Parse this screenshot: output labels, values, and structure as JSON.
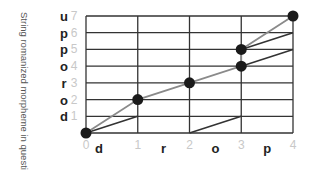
{
  "chart_data": {
    "type": "line",
    "title": "",
    "ylabel": "String romanized morpheme in question",
    "xlabel": "",
    "x_ticks": [
      "0",
      "1",
      "2",
      "3",
      "4"
    ],
    "y_ticks": [
      "1",
      "2",
      "3",
      "4",
      "5",
      "6",
      "7"
    ],
    "x_letters": [
      "d",
      "r",
      "o",
      "p"
    ],
    "y_letters": [
      "d",
      "o",
      "r",
      "o",
      "p",
      "p",
      "u"
    ],
    "xlim": [
      0,
      4
    ],
    "ylim": [
      0,
      7
    ],
    "grid": true,
    "points": [
      {
        "x": 0,
        "y": 0
      },
      {
        "x": 1,
        "y": 2
      },
      {
        "x": 2,
        "y": 3
      },
      {
        "x": 3,
        "y": 4
      },
      {
        "x": 3,
        "y": 5
      },
      {
        "x": 4,
        "y": 7
      }
    ],
    "gray_path": [
      [
        0,
        0
      ],
      [
        1,
        2
      ],
      [
        2,
        3
      ],
      [
        3,
        4
      ],
      [
        3,
        5
      ],
      [
        4,
        7
      ]
    ],
    "dark_segments": [
      [
        [
          0,
          0
        ],
        [
          1,
          1
        ]
      ],
      [
        [
          2,
          0
        ],
        [
          3,
          1
        ]
      ],
      [
        [
          3,
          4
        ],
        [
          4,
          5
        ]
      ],
      [
        [
          3,
          5
        ],
        [
          4,
          6
        ]
      ]
    ]
  },
  "labels": {
    "ylabel": "String romanized morpheme in question"
  }
}
